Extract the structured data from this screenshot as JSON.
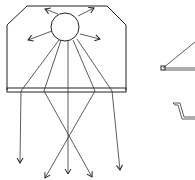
{
  "diagram": {
    "line_color": "#222222",
    "background": "#ffffff",
    "housing": {
      "outline": [
        [
          27,
          6
        ],
        [
          107,
          6
        ],
        [
          126,
          25
        ],
        [
          126,
          90
        ],
        [
          7,
          90
        ],
        [
          7,
          25
        ]
      ],
      "diffuser_plate": {
        "x": 7,
        "y": 88,
        "width": 119,
        "height": 4
      }
    },
    "lamp": {
      "cx": 65,
      "cy": 27,
      "r": 14
    },
    "reflected_rays": [
      {
        "from": [
          58,
          14
        ],
        "to": [
          45,
          9
        ]
      },
      {
        "from": [
          78,
          16
        ],
        "to": [
          94,
          8
        ]
      },
      {
        "from": [
          52,
          31
        ],
        "to": [
          28,
          40
        ]
      },
      {
        "from": [
          80,
          34
        ],
        "to": [
          100,
          39
        ]
      }
    ],
    "direct_rays": [
      {
        "from": [
          59,
          40
        ],
        "to": [
          20,
          163
        ]
      },
      {
        "from": [
          61,
          41
        ],
        "to": [
          92,
          177
        ]
      },
      {
        "from": [
          68,
          41
        ],
        "to": [
          68,
          174
        ]
      },
      {
        "from": [
          73,
          40
        ],
        "to": [
          45,
          178
        ]
      },
      {
        "from": [
          77,
          39
        ],
        "to": [
          120,
          170
        ]
      }
    ],
    "side_details": [
      {
        "name": "bracket-profile",
        "points": [
          [
            162,
            69
          ],
          [
            195,
            42
          ]
        ],
        "base": [
          [
            161,
            67
          ],
          [
            165,
            71
          ]
        ],
        "rail": [
          [
            165,
            69
          ],
          [
            195,
            69
          ]
        ]
      },
      {
        "name": "channel-profile",
        "points": [
          [
            173,
            103
          ],
          [
            178,
            104
          ],
          [
            181,
            117
          ],
          [
            195,
            117
          ]
        ]
      }
    ]
  }
}
